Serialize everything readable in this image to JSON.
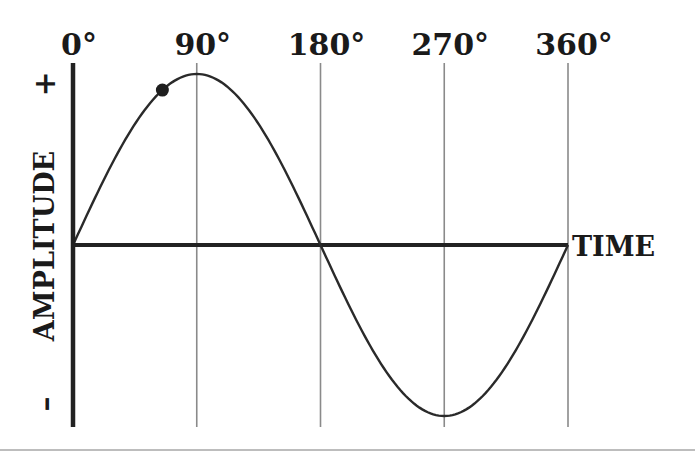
{
  "chart_data": {
    "type": "line",
    "title": "",
    "xlabel": "TIME",
    "ylabel": "AMPLITUDE",
    "y_positive_label": "+",
    "y_negative_label": "–",
    "x_ticks": [
      {
        "value": 0,
        "label": "0°"
      },
      {
        "value": 90,
        "label": "90°"
      },
      {
        "value": 180,
        "label": "180°"
      },
      {
        "value": 270,
        "label": "270°"
      },
      {
        "value": 360,
        "label": "360°"
      }
    ],
    "xlim": [
      0,
      360
    ],
    "ylim": [
      -1,
      1
    ],
    "grid": "vertical lines at tick values",
    "series": [
      {
        "name": "sine wave",
        "function": "sin(x)",
        "x_start": 0,
        "x_end": 360,
        "amplitude": 1
      }
    ],
    "marker": {
      "x": 65,
      "y": 0.906,
      "description": "point on sine curve"
    },
    "colors": {
      "curve": "#2a2a2a",
      "axes": "#222222",
      "grid": "#8a8a8a",
      "text": "#1a1a1a"
    }
  }
}
